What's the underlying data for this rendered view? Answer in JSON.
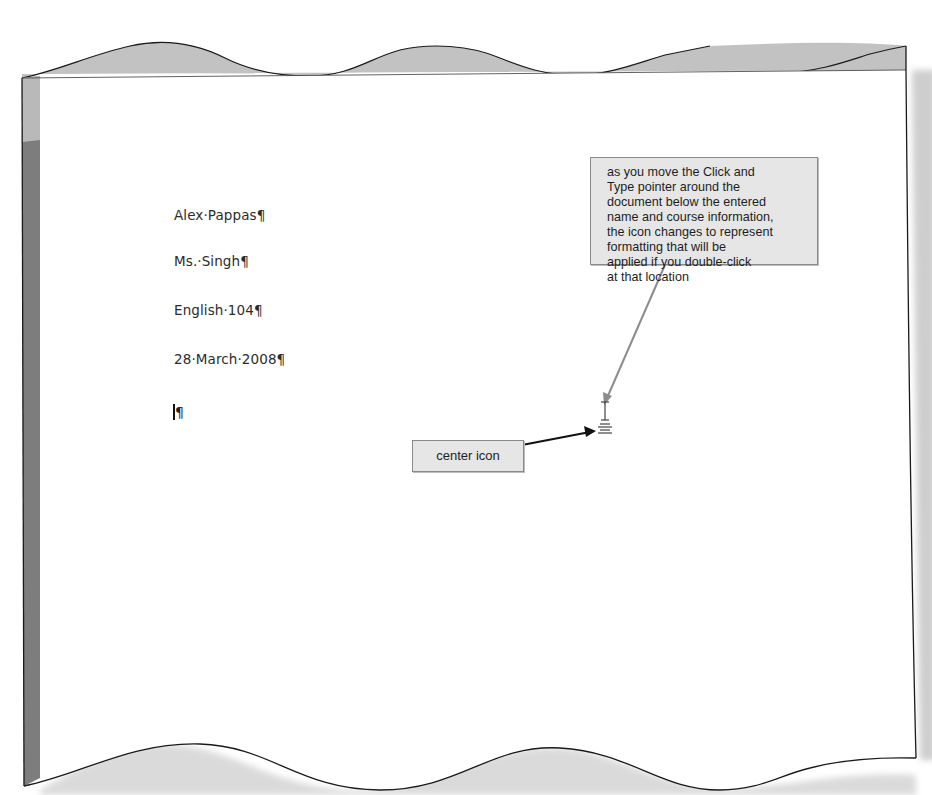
{
  "document": {
    "lines": [
      "Alex·Pappas¶",
      "Ms.·Singh¶",
      "English·104¶",
      "28·March·2008¶"
    ],
    "insertion_line_mark": "¶"
  },
  "callouts": {
    "main": {
      "lines": [
        "as you move the Click and",
        "Type pointer around the",
        "document below the entered",
        "name and course information,",
        "the icon changes to represent",
        "formatting that will be",
        "applied if you double-click",
        "at that location"
      ]
    },
    "center": {
      "label": "center icon"
    }
  },
  "icons": {
    "pointer": "click-and-type-center-pointer-icon"
  },
  "colors": {
    "callout_fill": "#e6e6e6",
    "callout_border": "#8a8a8a",
    "page_edge_shade": "#b8b8b8",
    "left_strip": "#7d7d7d",
    "text": "#2c2c2c"
  }
}
